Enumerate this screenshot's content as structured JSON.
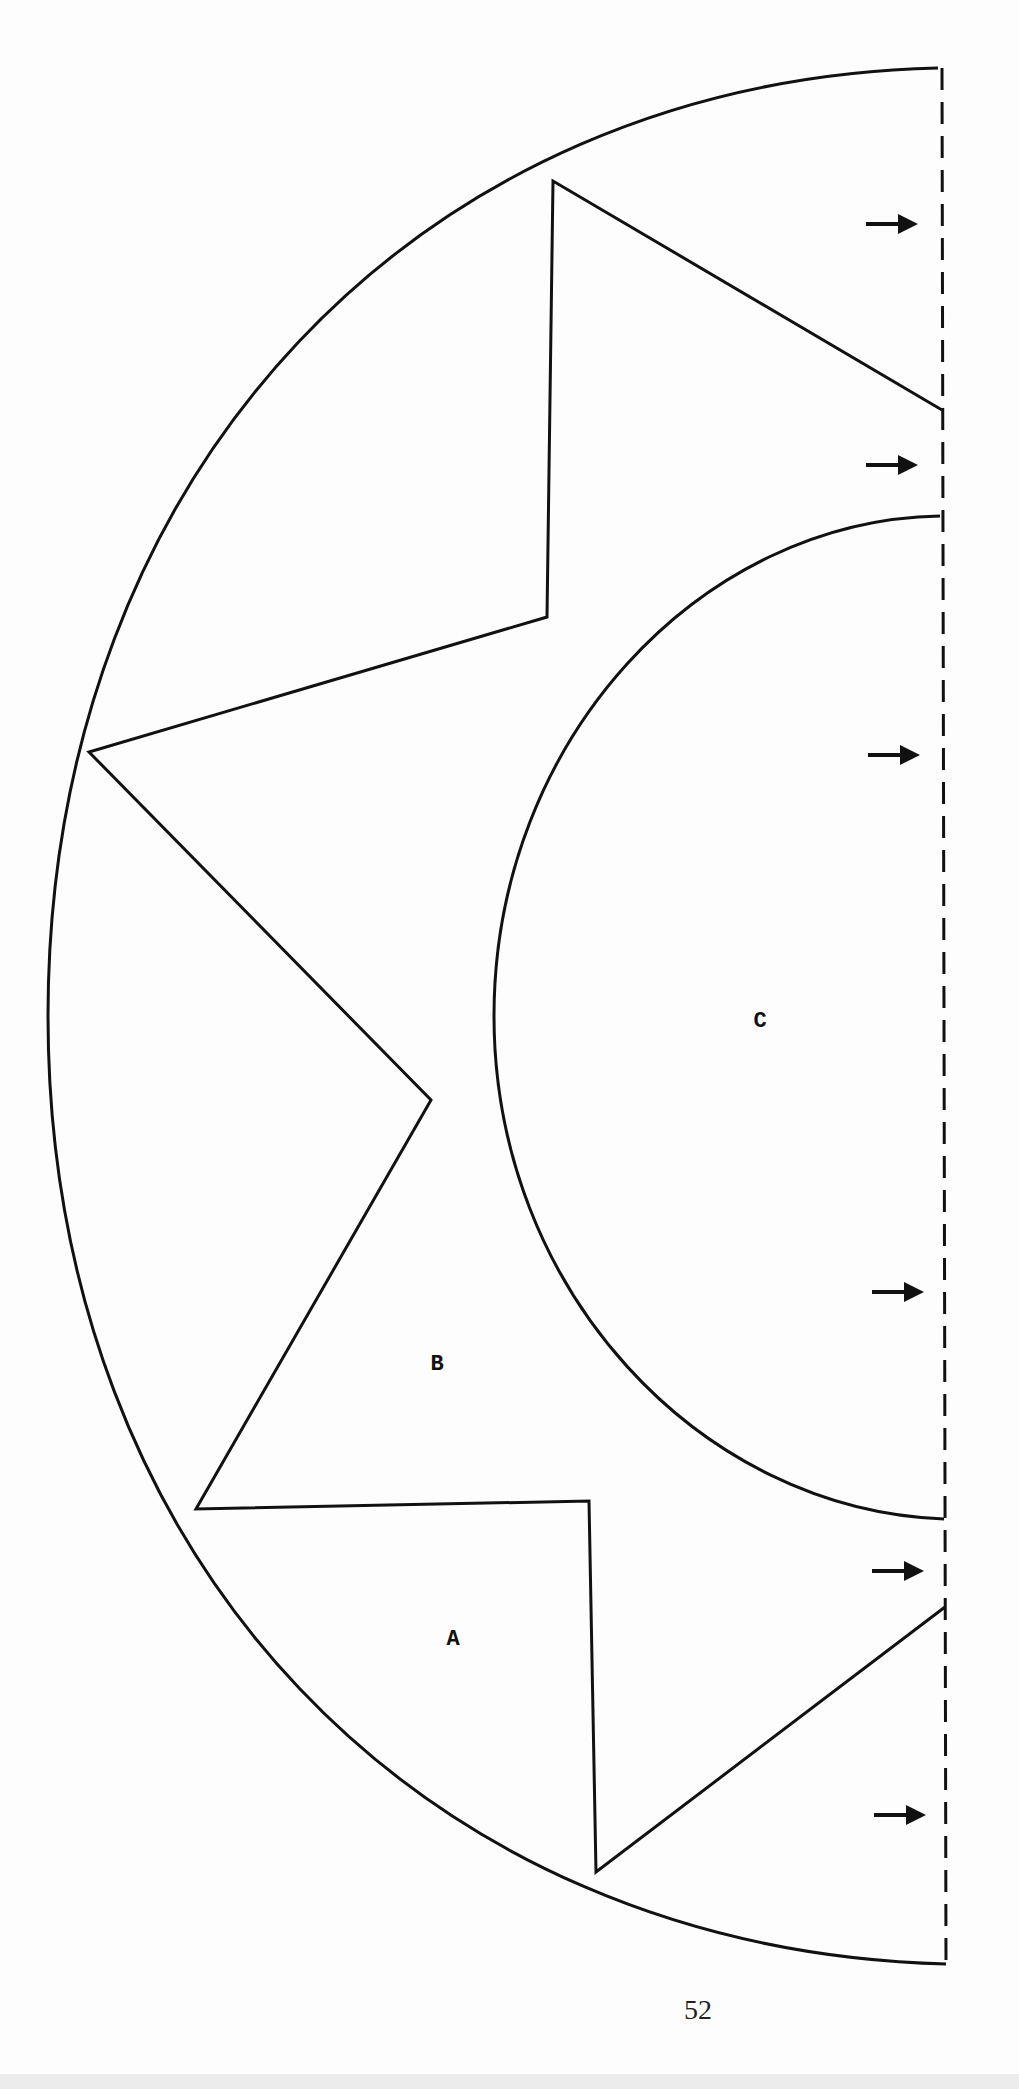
{
  "page": {
    "page_number": "52",
    "background": "#fdfdfd",
    "stroke_color": "#111111"
  },
  "diagram": {
    "type": "pattern-template",
    "pieces": [
      {
        "id": "A",
        "label": "A",
        "x": 453,
        "y": 1640
      },
      {
        "id": "B",
        "label": "B",
        "x": 437,
        "y": 1365
      },
      {
        "id": "C",
        "label": "C",
        "x": 760,
        "y": 1022
      }
    ],
    "fold_line": {
      "x": 942,
      "y_top": 68,
      "y_bottom": 1968,
      "style": "dashed"
    },
    "arrows": [
      {
        "y": 224,
        "x_start": 866,
        "x_end": 918
      },
      {
        "y": 465,
        "x_start": 866,
        "x_end": 918
      },
      {
        "y": 755,
        "x_start": 868,
        "x_end": 920
      },
      {
        "y": 1292,
        "x_start": 872,
        "x_end": 924
      },
      {
        "y": 1571,
        "x_start": 872,
        "x_end": 924
      },
      {
        "y": 1815,
        "x_start": 874,
        "x_end": 926
      }
    ],
    "outer_arc": {
      "top": [
        938,
        68
      ],
      "left_x": 48,
      "bottom": [
        946,
        1964
      ]
    },
    "inner_arc": {
      "top": [
        940,
        516
      ],
      "left_x": 494,
      "bottom": [
        944,
        1519
      ]
    },
    "star_points": [
      [
        942,
        410
      ],
      [
        553,
        181
      ],
      [
        547,
        617
      ],
      [
        89,
        752
      ],
      [
        431,
        1100
      ],
      [
        196,
        1509
      ],
      [
        589,
        1501
      ],
      [
        596,
        1872
      ],
      [
        945,
        1607
      ]
    ]
  }
}
